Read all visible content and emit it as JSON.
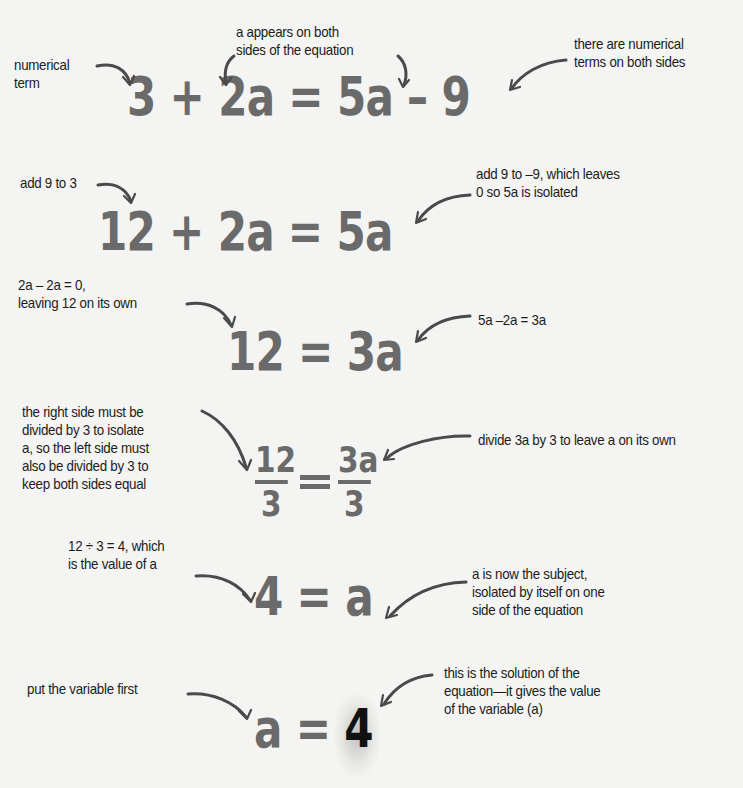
{
  "steps": [
    {
      "equation": {
        "tokens": [
          "3",
          "+",
          "2a",
          "=",
          "5a",
          "–",
          "9"
        ]
      },
      "annotations": {
        "numerical_term": "numerical\nterm",
        "a_both_sides": "a appears on both\nsides of the equation",
        "numerical_both_sides": "there are numerical\nterms on both sides"
      }
    },
    {
      "equation": {
        "tokens": [
          "12",
          "+",
          "2a",
          "=",
          "5a"
        ]
      },
      "annotations": {
        "add_9_to_3": "add 9 to 3",
        "add_9_to_minus_9": "add 9 to –9, which leaves\n0 so 5a is isolated"
      }
    },
    {
      "equation": {
        "tokens": [
          "12",
          "=",
          "3a"
        ]
      },
      "annotations": {
        "leaving_12": "2a – 2a = 0,\nleaving 12 on its own",
        "five_minus_two": "5a –2a = 3a"
      }
    },
    {
      "equation": {
        "left_num": "12",
        "left_den": "3",
        "right_num": "3a",
        "right_den": "3"
      },
      "annotations": {
        "divide_both": "the right side must be\ndivided by 3 to isolate\na, so the left side must\nalso be divided by 3 to\nkeep both sides equal",
        "divide_3a": "divide 3a by 3 to leave a on its own"
      }
    },
    {
      "equation": {
        "tokens": [
          "4",
          "=",
          "a"
        ]
      },
      "annotations": {
        "value_of_a": "12 ÷ 3 = 4, which\nis the value of a",
        "subject": "a is now the subject,\nisolated by itself on one\nside of the equation"
      }
    },
    {
      "equation": {
        "tokens": [
          "a",
          "=",
          "4"
        ]
      },
      "annotations": {
        "variable_first": "put the variable first",
        "solution": "this is the solution of the\nequation—it gives the value\nof the variable (a)"
      }
    }
  ],
  "colors": {
    "background": "#f4f4f2",
    "equation_gray": "#6a6a6a",
    "solution_black": "#111111",
    "annotation_text": "#1c1c1c",
    "arrow": "#4a4a4a"
  }
}
